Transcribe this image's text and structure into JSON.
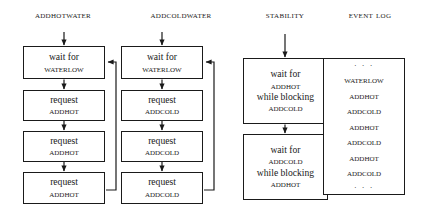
{
  "diagram": {
    "columns": [
      {
        "id": "addhotwater",
        "header": "AddHotWater",
        "steps": [
          {
            "line1": "wait for",
            "line2": "WaterLow"
          },
          {
            "line1": "request",
            "line2": "AddHot"
          },
          {
            "line1": "request",
            "line2": "AddHot"
          },
          {
            "line1": "request",
            "line2": "AddHot"
          }
        ]
      },
      {
        "id": "addcoldwater",
        "header": "AddColdWater",
        "steps": [
          {
            "line1": "wait for",
            "line2": "WaterLow"
          },
          {
            "line1": "request",
            "line2": "AddCold"
          },
          {
            "line1": "request",
            "line2": "AddCold"
          },
          {
            "line1": "request",
            "line2": "AddCold"
          }
        ]
      },
      {
        "id": "stability",
        "header": "Stability",
        "steps": [
          {
            "line1": "wait for",
            "line2": "AddHot",
            "line3": "while blocking",
            "line4": "AddCold"
          },
          {
            "line1": "wait for",
            "line2": "AddCold",
            "line3": "while blocking",
            "line4": "AddHot"
          }
        ]
      }
    ],
    "event_log": {
      "id": "eventlog",
      "header": "Event Log",
      "leading_ellipsis": "· · ·",
      "entries": [
        "WaterLow",
        "AddHot",
        "AddCold",
        "AddHot",
        "AddCold",
        "AddHot",
        "AddCold"
      ],
      "trailing_ellipsis": "· · ·"
    },
    "colors": {
      "stroke": "#1a1a1a",
      "background": "#ffffff",
      "text": "#1a1a1a"
    }
  }
}
